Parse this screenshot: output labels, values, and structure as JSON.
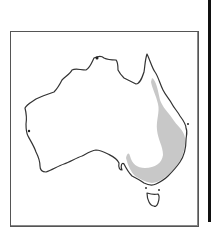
{
  "map": {
    "type": "species distribution map",
    "region": "Australia",
    "shaded_range": "eastern Australia — Queensland coast south through New South Wales and Victoria",
    "colors": {
      "frame": "#555555",
      "coastline": "#333333",
      "land": "#ffffff",
      "range_fill": "#c8c8c8",
      "edge_bar": "#111111"
    }
  }
}
